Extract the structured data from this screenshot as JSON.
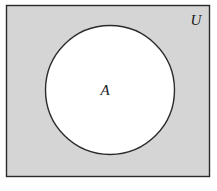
{
  "figure": {
    "name": "venn-diagram-subset",
    "width": 217,
    "height": 191,
    "background_color": "#ffffff"
  },
  "universe": {
    "label": "U",
    "shape": "rectangle",
    "fill_color": "#d5d5d5",
    "stroke_color": "#2b2b2b",
    "x": 6,
    "y": 5,
    "width": 204,
    "height": 172,
    "label_x": 196,
    "label_y": 25
  },
  "set_a": {
    "label": "A",
    "shape": "circle",
    "fill_color": "#ffffff",
    "stroke_color": "#2b2b2b",
    "center_x": 110,
    "center_y": 90,
    "radius": 65,
    "label_x": 105,
    "label_y": 95
  }
}
